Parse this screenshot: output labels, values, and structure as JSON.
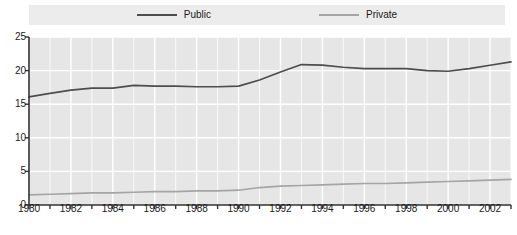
{
  "legend": {
    "position": "top-center",
    "entries": [
      {
        "label": "Public",
        "color": "#4d4d4d",
        "icon": "line-swatch-icon"
      },
      {
        "label": "Private",
        "color": "#a5a5a5",
        "icon": "line-swatch-icon"
      }
    ]
  },
  "colors": {
    "public": "#4d4d4d",
    "private": "#a5a5a5",
    "plot_background": "#e6e6e6",
    "legend_background": "#ececec",
    "gridline": "#ffffff",
    "axis": "#333333",
    "page_background": "#ffffff"
  },
  "chart_data": {
    "type": "line",
    "title": "",
    "subtitle": "",
    "xlabel": "",
    "ylabel": "",
    "xlim": [
      1980,
      2003
    ],
    "ylim": [
      0,
      25
    ],
    "grid": true,
    "legend_position": "top-center",
    "yticks": [
      0,
      5,
      10,
      15,
      20,
      25
    ],
    "ytick_labels": [
      "0",
      "5",
      "10",
      "15",
      "20",
      "25"
    ],
    "xticks": [
      1980,
      1982,
      1984,
      1986,
      1988,
      1990,
      1992,
      1994,
      1996,
      1998,
      2000,
      2002
    ],
    "xtick_labels": [
      "1980",
      "1982",
      "1984",
      "1986",
      "1988",
      "1990",
      "1992",
      "1994",
      "1996",
      "1998",
      "2000",
      "2002"
    ],
    "x": [
      1980,
      1981,
      1982,
      1983,
      1984,
      1985,
      1986,
      1987,
      1988,
      1989,
      1990,
      1991,
      1992,
      1993,
      1994,
      1995,
      1996,
      1997,
      1998,
      1999,
      2000,
      2001,
      2002,
      2003
    ],
    "series": [
      {
        "name": "Public",
        "color": "#4d4d4d",
        "values": [
          16.1,
          16.6,
          17.1,
          17.4,
          17.4,
          17.8,
          17.7,
          17.7,
          17.6,
          17.6,
          17.7,
          18.6,
          19.8,
          20.9,
          20.8,
          20.5,
          20.3,
          20.3,
          20.3,
          20.0,
          19.9,
          20.3,
          20.8,
          21.3
        ]
      },
      {
        "name": "Private",
        "color": "#a5a5a5",
        "values": [
          1.5,
          1.6,
          1.7,
          1.8,
          1.8,
          1.9,
          2.0,
          2.0,
          2.1,
          2.1,
          2.2,
          2.6,
          2.8,
          2.9,
          3.0,
          3.1,
          3.2,
          3.2,
          3.3,
          3.4,
          3.5,
          3.6,
          3.7,
          3.8
        ]
      }
    ]
  }
}
